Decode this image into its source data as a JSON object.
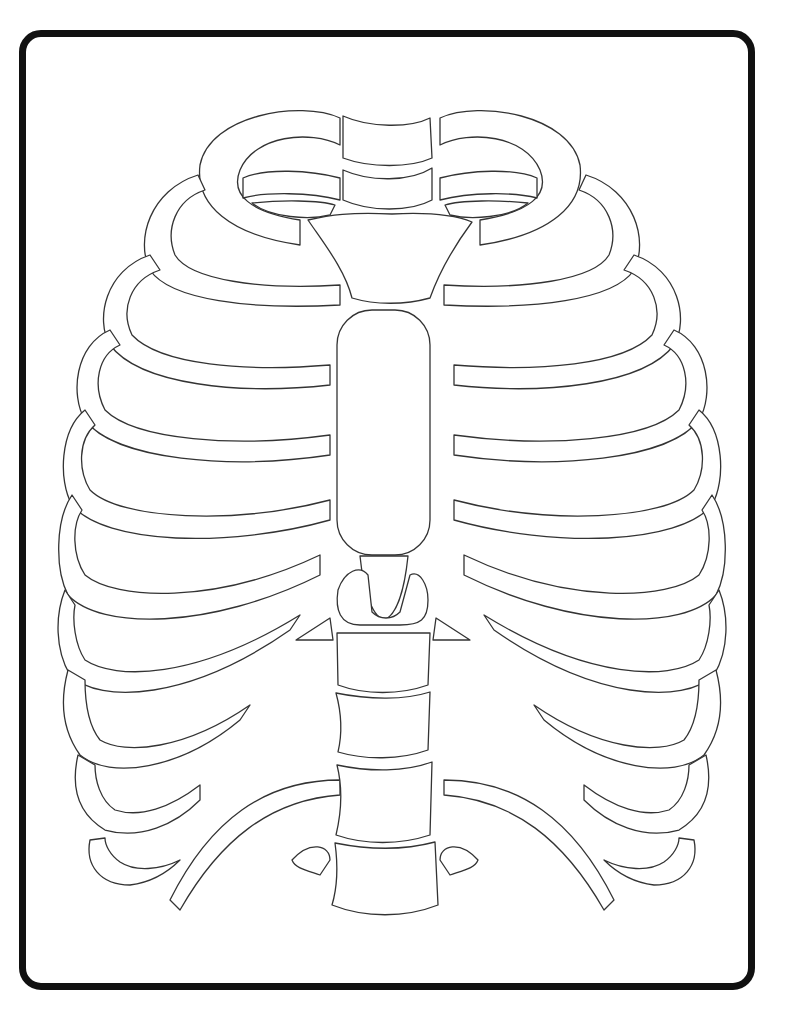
{
  "page": {
    "style": "black outline line art on white",
    "border": {
      "color": "#111111",
      "radius": 22,
      "stroke_width": 7
    },
    "line_color": "#333333",
    "background": "#ffffff"
  },
  "anatomy": {
    "parts": [
      "clavicle-left",
      "clavicle-right",
      "manubrium",
      "sternum-body",
      "xiphoid-process",
      "ribs-left",
      "ribs-right",
      "thoracic-vertebrae",
      "floating-ribs"
    ],
    "rib_pairs_visible": 12,
    "vertebrae_visible": 4
  }
}
